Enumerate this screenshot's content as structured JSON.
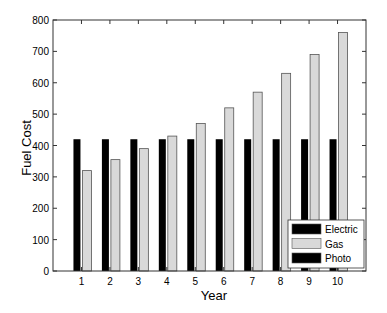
{
  "chart_data": {
    "type": "bar",
    "title": "",
    "xlabel": "Year",
    "ylabel": "Fuel Cost",
    "categories": [
      "1",
      "2",
      "3",
      "4",
      "5",
      "6",
      "7",
      "8",
      "9",
      "10"
    ],
    "series": [
      {
        "name": "Electric",
        "color": "#000000",
        "values": [
          420,
          420,
          420,
          420,
          420,
          420,
          420,
          420,
          420,
          420
        ]
      },
      {
        "name": "Gas",
        "color": "#d9d9d9",
        "values": [
          320,
          355,
          390,
          430,
          470,
          520,
          570,
          630,
          690,
          760
        ]
      },
      {
        "name": "Photo",
        "color": "#000000",
        "values": [
          0,
          0,
          0,
          0,
          0,
          0,
          0,
          0,
          0,
          0
        ]
      }
    ],
    "ylim": [
      0,
      800
    ],
    "yticks": [
      0,
      100,
      200,
      300,
      400,
      500,
      600,
      700,
      800
    ],
    "xlim": [
      0,
      11
    ],
    "grid": false,
    "legend_position": "lower right"
  }
}
